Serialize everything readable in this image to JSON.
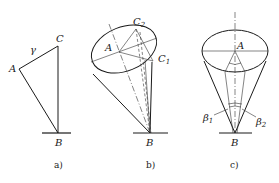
{
  "figure": {
    "panels": [
      {
        "id": "a",
        "caption": "a)",
        "labels": {
          "A": "A",
          "B": "B",
          "C": "C",
          "gamma": "γ"
        }
      },
      {
        "id": "b",
        "caption": "b)",
        "labels": {
          "A": "A",
          "B": "B",
          "C2": "C",
          "C2_sub": "2",
          "C1": "C",
          "C1_sub": "1"
        }
      },
      {
        "id": "c",
        "caption": "c)",
        "labels": {
          "A": "A",
          "B": "B",
          "beta1": "β",
          "beta1_sub": "1",
          "beta2": "β",
          "beta2_sub": "2"
        }
      }
    ],
    "colors": {
      "line": "#1a1a1a",
      "background": "#ffffff"
    }
  }
}
